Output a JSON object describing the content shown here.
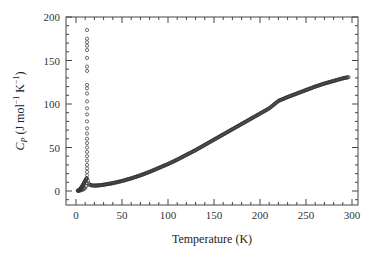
{
  "chart_data": {
    "type": "scatter",
    "title": "",
    "xlabel": "Temperature (K)",
    "ylabel": "C_P (J mol^-1 K^-1)",
    "ylabel_parts": {
      "main": "C",
      "sub": "P",
      "units": " (J mol",
      "exp1": "−1",
      "mid": " K",
      "exp2": "−1",
      "close": ")"
    },
    "xlim": [
      -7,
      307
    ],
    "ylim": [
      -16,
      200
    ],
    "xticks": [
      0,
      50,
      100,
      150,
      200,
      250,
      300
    ],
    "yticks": [
      0,
      50,
      100,
      150,
      200
    ],
    "grid": false,
    "legend": null,
    "marker": "open-circle",
    "series": [
      {
        "name": "Cp data",
        "points": [
          [
            2,
            0.2
          ],
          [
            3,
            0.3
          ],
          [
            4,
            0.5
          ],
          [
            5,
            0.8
          ],
          [
            6,
            1.1
          ],
          [
            7,
            1.5
          ],
          [
            8,
            2.0
          ],
          [
            9,
            2.6
          ],
          [
            10,
            3.5
          ],
          [
            11,
            5.5
          ],
          [
            11.5,
            9
          ],
          [
            11.8,
            14
          ],
          [
            12,
            18
          ],
          [
            12,
            22
          ],
          [
            12,
            26
          ],
          [
            12,
            30
          ],
          [
            12,
            35
          ],
          [
            12,
            40
          ],
          [
            12,
            45
          ],
          [
            12,
            50
          ],
          [
            12,
            55
          ],
          [
            12,
            60
          ],
          [
            12,
            66
          ],
          [
            12,
            72
          ],
          [
            12,
            80
          ],
          [
            12,
            88
          ],
          [
            12,
            95
          ],
          [
            12,
            103
          ],
          [
            12,
            112
          ],
          [
            12,
            118
          ],
          [
            12,
            122
          ],
          [
            12,
            138
          ],
          [
            12,
            143
          ],
          [
            12,
            153
          ],
          [
            12,
            162
          ],
          [
            12,
            167
          ],
          [
            12,
            171
          ],
          [
            12,
            175
          ],
          [
            12,
            185
          ],
          [
            13,
            12
          ],
          [
            14,
            8
          ],
          [
            15,
            7
          ],
          [
            17,
            6.5
          ],
          [
            20,
            6.2
          ],
          [
            25,
            6.5
          ],
          [
            30,
            7.2
          ],
          [
            40,
            9
          ],
          [
            50,
            11.5
          ],
          [
            60,
            14.5
          ],
          [
            70,
            18
          ],
          [
            80,
            22
          ],
          [
            90,
            26.5
          ],
          [
            100,
            31
          ],
          [
            110,
            36
          ],
          [
            120,
            41.5
          ],
          [
            130,
            47
          ],
          [
            140,
            53
          ],
          [
            150,
            59
          ],
          [
            160,
            65
          ],
          [
            170,
            71
          ],
          [
            175,
            74
          ],
          [
            180,
            77
          ],
          [
            190,
            83
          ],
          [
            200,
            89
          ],
          [
            210,
            95
          ],
          [
            220,
            103.5
          ],
          [
            230,
            108
          ],
          [
            240,
            112
          ],
          [
            250,
            116
          ],
          [
            260,
            120
          ],
          [
            270,
            123.5
          ],
          [
            280,
            126.5
          ],
          [
            290,
            129.5
          ],
          [
            297,
            131
          ]
        ]
      }
    ]
  }
}
